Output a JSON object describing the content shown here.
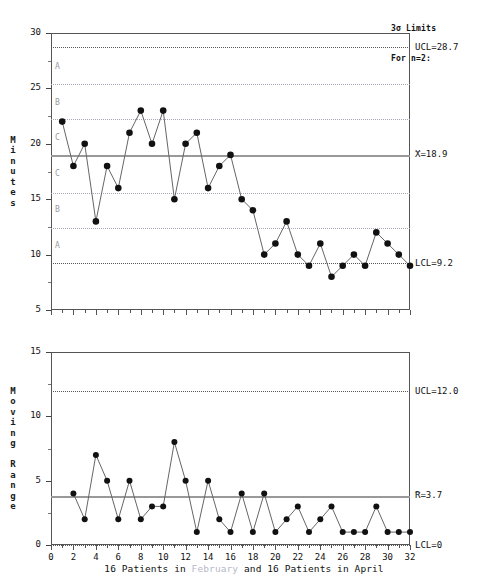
{
  "header": {
    "line1": "3σ Limits",
    "line2": "For n=2:"
  },
  "x_caption": {
    "part1": "16 Patients in ",
    "part2": "February",
    "part3": " and 16 Patients in April",
    "full": "16 Patients in February and 16 Patients in April"
  },
  "individuals": {
    "y_axis_title": "Minutes",
    "y_ticks": [
      5,
      10,
      15,
      20,
      25,
      30
    ],
    "y_min": 5,
    "y_max": 30,
    "ucl_label": "UCL=28.7",
    "center_label": "X=18.9",
    "center_overbar": "_",
    "lcl_label": "LCL=9.2",
    "ucl": 28.7,
    "center": 18.9,
    "lcl": 9.2,
    "zone_boundaries": [
      12.4,
      15.6,
      22.2,
      25.4
    ],
    "zones": [
      {
        "label": "A",
        "value": 26.9
      },
      {
        "label": "B",
        "value": 23.7
      },
      {
        "label": "C",
        "value": 20.5
      },
      {
        "label": "C",
        "value": 17.3
      },
      {
        "label": "B",
        "value": 14.0
      },
      {
        "label": "A",
        "value": 10.8
      }
    ]
  },
  "moving_range": {
    "y_axis_title": "Moving Range",
    "y_ticks": [
      0,
      5,
      10,
      15
    ],
    "y_min": 0,
    "y_max": 15,
    "ucl_label": "UCL=12.0",
    "center_label": "R=3.7",
    "center_overbar": "_",
    "lcl_label": "LCL=0",
    "ucl": 12.0,
    "center": 3.7,
    "lcl": 0
  },
  "x_axis": {
    "min": 0,
    "max": 32,
    "ticks": [
      0,
      2,
      4,
      6,
      8,
      10,
      12,
      14,
      16,
      18,
      20,
      22,
      24,
      26,
      28,
      30,
      32
    ],
    "tick_labels": [
      "0",
      "2",
      "4",
      "6",
      "8",
      "10",
      "12",
      "14",
      "16",
      "18",
      "20",
      "22",
      "24",
      "26",
      "28",
      "30",
      "32"
    ],
    "minor_step": 1
  },
  "chart_data": [
    {
      "type": "line",
      "title": "Individuals Chart",
      "xlabel": "16 Patients in February and 16 Patients in April",
      "ylabel": "Minutes",
      "ylim": [
        5,
        30
      ],
      "xlim": [
        0,
        32
      ],
      "grid": false,
      "x": [
        1,
        2,
        3,
        4,
        5,
        6,
        7,
        8,
        9,
        10,
        11,
        12,
        13,
        14,
        15,
        16,
        17,
        18,
        19,
        20,
        21,
        22,
        23,
        24,
        25,
        26,
        27,
        28,
        29,
        30,
        31,
        32
      ],
      "values": [
        22,
        18,
        20,
        13,
        18,
        16,
        21,
        23,
        20,
        23,
        15,
        20,
        21,
        16,
        18,
        19,
        15,
        14,
        10,
        11,
        13,
        10,
        9,
        11,
        8,
        9,
        10,
        9,
        12,
        11,
        10,
        9
      ],
      "control_limits": {
        "UCL": 28.7,
        "CL": 18.9,
        "LCL": 9.2
      },
      "zone_lines": [
        12.4,
        15.6,
        22.2,
        25.4
      ],
      "annotations": [
        "UCL=28.7",
        "X=18.9",
        "LCL=9.2",
        "A",
        "B",
        "C",
        "C",
        "B",
        "A"
      ]
    },
    {
      "type": "line",
      "title": "Moving Range Chart",
      "xlabel": "16 Patients in February and 16 Patients in April",
      "ylabel": "Moving Range",
      "ylim": [
        0,
        15
      ],
      "xlim": [
        0,
        32
      ],
      "grid": false,
      "x": [
        2,
        3,
        4,
        5,
        6,
        7,
        8,
        9,
        10,
        11,
        12,
        13,
        14,
        15,
        16,
        17,
        18,
        19,
        20,
        21,
        22,
        23,
        24,
        25,
        26,
        27,
        28,
        29,
        30,
        31,
        32
      ],
      "values": [
        4,
        2,
        7,
        5,
        2,
        5,
        2,
        3,
        3,
        8,
        5,
        1,
        5,
        2,
        1,
        4,
        1,
        4,
        1,
        2,
        3,
        1,
        2,
        3,
        1,
        1,
        1,
        3,
        1,
        1,
        1
      ],
      "control_limits": {
        "UCL": 12.0,
        "CL": 3.7,
        "LCL": 0
      },
      "annotations": [
        "UCL=12.0",
        "R=3.7",
        "LCL=0"
      ]
    }
  ]
}
